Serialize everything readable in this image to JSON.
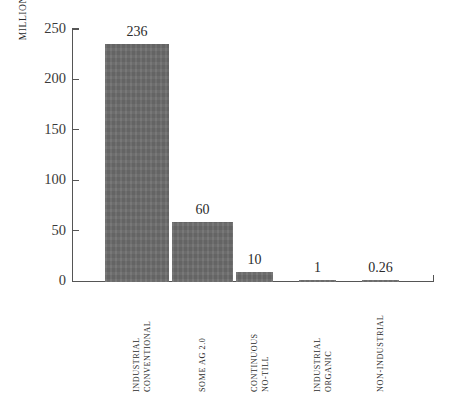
{
  "chart_data": {
    "type": "bar",
    "title": "",
    "subtitle": "",
    "xlabel": "",
    "ylabel": "MILLIONS OF ACRES",
    "ylim": [
      0,
      250
    ],
    "yticks": [
      0,
      50,
      100,
      150,
      200,
      250
    ],
    "ytick_labels": [
      "0",
      "50",
      "100",
      "150",
      "200",
      "250"
    ],
    "grid": false,
    "legend": "none",
    "categories": [
      "INDUSTRIAL CONVENTIONAL",
      "SOME AG 2.0",
      "CONTINUOUS NO-TILL",
      "INDUSTRIAL ORGANIC",
      "NON-INDUSTRIAL"
    ],
    "category_lines": [
      [
        "INDUSTRIAL",
        "CONVENTIONAL"
      ],
      [
        "SOME AG 2.0"
      ],
      [
        "CONTINUOUS",
        "NO-TILL"
      ],
      [
        "INDUSTRIAL",
        "ORGANIC"
      ],
      [
        "NON-INDUSTRIAL"
      ]
    ],
    "values": [
      236,
      60,
      10,
      1,
      0.26
    ],
    "value_labels": [
      "236",
      "60",
      "10",
      "1",
      "0.26"
    ],
    "bar_color": "#6d6d6d",
    "axis_color": "#555555",
    "text_color": "#2b2b2b",
    "background": "#ffffff"
  }
}
